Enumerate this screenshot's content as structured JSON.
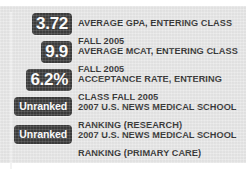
{
  "panel": {
    "background_color": "#e7e7e7",
    "badge_color": "#2f2f2f",
    "badge_text_color": "#ffffff",
    "label_text_color": "#282828",
    "rows": [
      {
        "badge_value": "3.72",
        "badge_style": "numeric",
        "label": "AVERAGE GPA, ENTERING CLASS FALL 2005"
      },
      {
        "badge_value": "9.9",
        "badge_style": "numeric",
        "label": "AVERAGE MCAT, ENTERING CLASS FALL 2005"
      },
      {
        "badge_value": "6.2%",
        "badge_style": "numeric",
        "label": "ACCEPTANCE RATE, ENTERING CLASS FALL 2005"
      },
      {
        "badge_value": "Unranked",
        "badge_style": "word",
        "label": "2007 U.S. NEWS MEDICAL SCHOOL RANKING (RESEARCH)"
      },
      {
        "badge_value": "Unranked",
        "badge_style": "word",
        "label": "2007 U.S. NEWS MEDICAL SCHOOL RANKING (PRIMARY CARE)"
      }
    ]
  }
}
